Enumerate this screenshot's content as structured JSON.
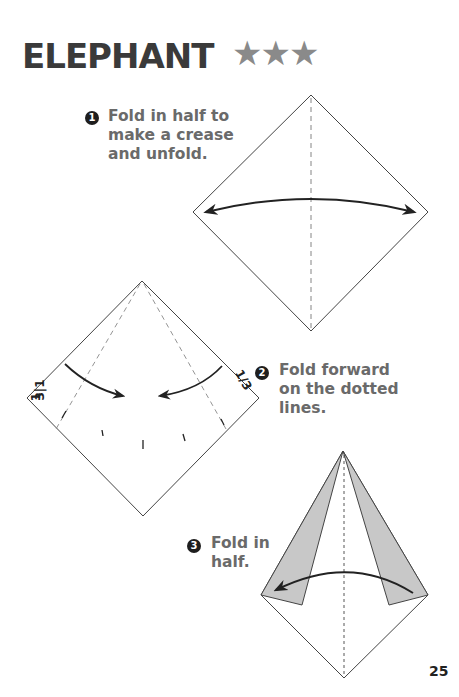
{
  "page": {
    "title": "ELEPHANT",
    "difficulty_stars": "★★★",
    "difficulty_level": 3,
    "page_number": "25"
  },
  "steps": [
    {
      "number": "1",
      "lines": [
        "Fold in half to",
        "make a crease",
        "and unfold."
      ]
    },
    {
      "number": "2",
      "lines": [
        "Fold forward",
        "on the dotted",
        "lines."
      ]
    },
    {
      "number": "3",
      "lines": [
        "Fold in",
        "half."
      ]
    }
  ],
  "diagrams": {
    "step2_fraction_left": "1/3",
    "step2_fraction_right": "1/3"
  },
  "colors": {
    "title": "#3a3a3a",
    "stars": "#8a8a8a",
    "step_text": "#6a6a6a",
    "step_badge": "#1e1e1e",
    "flap_fill": "#c8c8c8"
  }
}
